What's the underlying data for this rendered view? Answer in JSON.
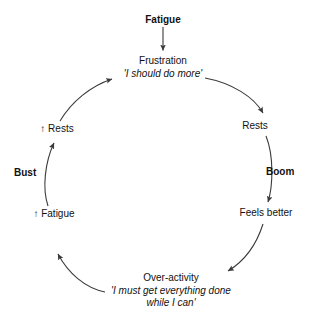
{
  "diagram": {
    "background_color": "#ffffff",
    "line_color": "#3a3a3a",
    "text_color": "#111111",
    "nodes": [
      {
        "id": "fatigue-top",
        "label": "Fatigue",
        "style": "bold",
        "position": "top"
      },
      {
        "id": "frustration",
        "label": "Frustration",
        "quote": "'I should do more'",
        "style": "normal",
        "position": "upper-center"
      },
      {
        "id": "rests",
        "label": "Rests",
        "style": "normal",
        "position": "right"
      },
      {
        "id": "feels-better",
        "label": "Feels better",
        "style": "normal",
        "position": "lower-right"
      },
      {
        "id": "over-activity",
        "label": "Over-activity",
        "quote_line1": "'I must get everything done",
        "quote_line2": "while I can'",
        "style": "normal",
        "position": "bottom"
      },
      {
        "id": "increased-fatigue",
        "label": "↑ Fatigue",
        "style": "normal",
        "position": "lower-left"
      },
      {
        "id": "increased-rests",
        "label": "↑ Rests",
        "style": "normal",
        "position": "left"
      }
    ],
    "phase_labels": [
      {
        "id": "boom",
        "label": "Boom",
        "side": "right"
      },
      {
        "id": "bust",
        "label": "Bust",
        "side": "left"
      }
    ],
    "arrows": [
      {
        "id": "fatigue-to-frustration",
        "from": "fatigue-top",
        "to": "frustration",
        "shape": "straight-down"
      },
      {
        "id": "frustration-to-rests",
        "from": "frustration",
        "to": "rests",
        "shape": "curve-right-down"
      },
      {
        "id": "rests-to-feels-better",
        "from": "rests",
        "to": "feels-better",
        "shape": "curve-down",
        "label": "Boom"
      },
      {
        "id": "feels-better-to-over-activity",
        "from": "feels-better",
        "to": "over-activity",
        "shape": "curve-down-left"
      },
      {
        "id": "over-activity-to-increased-fatigue",
        "from": "over-activity",
        "to": "increased-fatigue",
        "shape": "curve-left-up"
      },
      {
        "id": "increased-fatigue-to-increased-rests",
        "from": "increased-fatigue",
        "to": "increased-rests",
        "shape": "curve-up",
        "label": "Bust"
      },
      {
        "id": "increased-rests-to-frustration",
        "from": "increased-rests",
        "to": "frustration",
        "shape": "curve-up-right"
      }
    ]
  }
}
